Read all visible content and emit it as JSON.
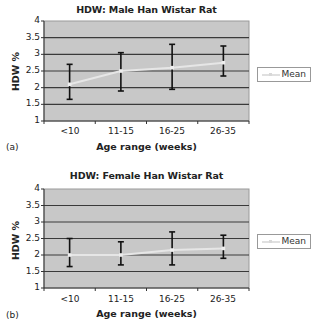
{
  "chart_data": [
    {
      "type": "line",
      "panel_label": "(a)",
      "title": "HDW: Male Han Wistar Rat",
      "xlabel": "Age range (weeks)",
      "ylabel": "HDW %",
      "categories": [
        "<10",
        "11-15",
        "16-25",
        "26-35"
      ],
      "y_ticks": [
        "4",
        "3.5",
        "3",
        "2.5",
        "2",
        "1.5",
        "1"
      ],
      "ylim": [
        1,
        4
      ],
      "grid": true,
      "legend_position": "right",
      "series": [
        {
          "name": "Mean",
          "values": [
            2.1,
            2.5,
            2.6,
            2.75
          ],
          "error_upper": [
            2.7,
            3.05,
            3.3,
            3.25
          ],
          "error_lower": [
            1.65,
            1.9,
            1.95,
            2.35
          ],
          "color": "#e6e6e6"
        }
      ]
    },
    {
      "type": "line",
      "panel_label": "(b)",
      "title": "HDW: Female Han Wistar Rat",
      "xlabel": "Age range (weeks)",
      "ylabel": "HDW %",
      "categories": [
        "<10",
        "11-15",
        "16-25",
        "26-35"
      ],
      "y_ticks": [
        "4",
        "3.5",
        "3",
        "2.5",
        "2",
        "1.5",
        "1"
      ],
      "ylim": [
        1,
        4
      ],
      "grid": true,
      "legend_position": "right",
      "series": [
        {
          "name": "Mean",
          "values": [
            2.0,
            2.0,
            2.15,
            2.2
          ],
          "error_upper": [
            2.5,
            2.4,
            2.7,
            2.6
          ],
          "error_lower": [
            1.65,
            1.7,
            1.7,
            1.9
          ],
          "color": "#e6e6e6"
        }
      ]
    }
  ],
  "colors": {
    "plot_background": "#c8c8c8",
    "gridline": "#3a3a3a",
    "error_bar": "#111111",
    "mean_line": "#e6e6e6"
  }
}
